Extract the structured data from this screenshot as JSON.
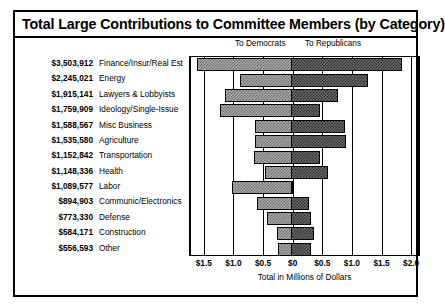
{
  "chart_data": {
    "type": "bar",
    "title": "Total Large Contributions to Committee Members (by Category)",
    "xlabel": "Total in Millions of Dollars",
    "ylabel": "",
    "orientation": "horizontal",
    "stacked": "diverging",
    "grid": true,
    "legend_position": "top",
    "xlim": [
      -1.75,
      2.15
    ],
    "xticks": [
      -1.5,
      -1.0,
      -0.5,
      0,
      0.5,
      1.0,
      1.5,
      2.0
    ],
    "xticklabels": [
      "$1.5",
      "$1.0",
      "$0.5",
      "$0",
      "$0.5",
      "$1.0",
      "$1.5",
      "$2.0"
    ],
    "legend": [
      "To Democrats",
      "To Republicans"
    ],
    "categories": [
      "Finance/Insur/Real Est",
      "Energy",
      "Lawyers & Lobbyists",
      "Ideology/Single-Issue",
      "Misc Business",
      "Agriculture",
      "Transportation",
      "Health",
      "Labor",
      "Communic/Electronics",
      "Defense",
      "Construction",
      "Other"
    ],
    "totals_labels": [
      "$3,503,912",
      "$2,245,021",
      "$1,915,141",
      "$1,759,909",
      "$1,588,567",
      "$1,535,580",
      "$1,152,842",
      "$1,148,336",
      "$1,089,577",
      "$894,903",
      "$773,330",
      "$584,171",
      "$556,593"
    ],
    "totals_values": [
      3503912,
      2245021,
      1915141,
      1759909,
      1588567,
      1535580,
      1152842,
      1148336,
      1089577,
      894903,
      773330,
      584171,
      556593
    ],
    "series": [
      {
        "name": "To Democrats",
        "values": [
          1.62,
          0.89,
          1.14,
          1.22,
          0.63,
          0.63,
          0.66,
          0.47,
          1.03,
          0.61,
          0.44,
          0.27,
          0.24
        ]
      },
      {
        "name": "To Republicans",
        "values": [
          1.84,
          1.27,
          0.76,
          0.47,
          0.89,
          0.9,
          0.47,
          0.6,
          0.01,
          0.27,
          0.31,
          0.36,
          0.31
        ]
      }
    ]
  },
  "legend": {
    "democrats": "To Democrats",
    "republicans": "To Republicans"
  },
  "axis": {
    "title": "Total in Millions of Dollars"
  }
}
